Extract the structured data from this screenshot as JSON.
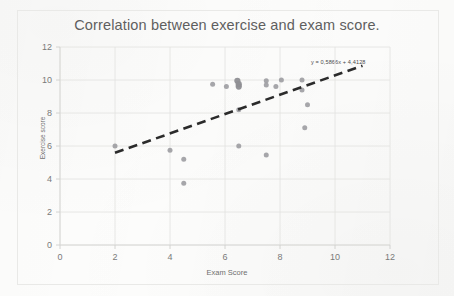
{
  "chart_data": {
    "type": "scatter",
    "title": "Correlation between exercise and exam score.",
    "xlabel": "Exam Score",
    "ylabel": "Exercise score",
    "xlim": [
      0,
      12
    ],
    "ylim": [
      0,
      12
    ],
    "xticks": [
      0,
      2,
      4,
      6,
      8,
      10,
      12
    ],
    "yticks": [
      0,
      2,
      4,
      6,
      8,
      10,
      12
    ],
    "grid": true,
    "legend": "none",
    "series": [
      {
        "name": "Exercise vs exam score",
        "marker_color": "#9a9a9e",
        "points": [
          {
            "x": 2.0,
            "y": 6.0
          },
          {
            "x": 4.0,
            "y": 5.75
          },
          {
            "x": 4.5,
            "y": 5.2
          },
          {
            "x": 4.5,
            "y": 3.75
          },
          {
            "x": 5.55,
            "y": 9.75
          },
          {
            "x": 6.05,
            "y": 9.6
          },
          {
            "x": 6.45,
            "y": 9.95
          },
          {
            "x": 6.5,
            "y": 9.75
          },
          {
            "x": 6.5,
            "y": 9.6
          },
          {
            "x": 6.5,
            "y": 8.2
          },
          {
            "x": 6.5,
            "y": 6.0
          },
          {
            "x": 7.5,
            "y": 9.95
          },
          {
            "x": 7.5,
            "y": 9.7
          },
          {
            "x": 7.5,
            "y": 5.45
          },
          {
            "x": 7.85,
            "y": 9.6
          },
          {
            "x": 8.05,
            "y": 10.0
          },
          {
            "x": 8.8,
            "y": 10.0
          },
          {
            "x": 8.8,
            "y": 9.4
          },
          {
            "x": 9.0,
            "y": 8.5
          },
          {
            "x": 8.9,
            "y": 7.1
          }
        ]
      }
    ],
    "trendline": {
      "label": "y = 0,5866x + 4,4128",
      "slope": 0.5866,
      "intercept": 4.4128,
      "x_start": 2.0,
      "x_end": 11.0,
      "style": "dashed",
      "color": "#2b2b2b"
    }
  }
}
